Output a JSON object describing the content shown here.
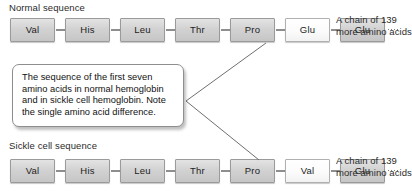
{
  "figure": {
    "title_normal": "Normal sequence",
    "title_sickle": "Sickle cell sequence",
    "callout_text": "The sequence of the first seven amino acids in normal hemoglobin and in sickle cell hemoglobin. Note the single amino acid difference.",
    "tail_normal": "A chain of 139 more amino acids",
    "tail_sickle": "A chain of 139 more amino acids",
    "normal_sequence": [
      {
        "label": "Val",
        "highlight": false
      },
      {
        "label": "His",
        "highlight": false
      },
      {
        "label": "Leu",
        "highlight": false
      },
      {
        "label": "Thr",
        "highlight": false
      },
      {
        "label": "Pro",
        "highlight": false
      },
      {
        "label": "Glu",
        "highlight": true
      },
      {
        "label": "Glu",
        "highlight": false
      }
    ],
    "sickle_sequence": [
      {
        "label": "Val",
        "highlight": false
      },
      {
        "label": "His",
        "highlight": false
      },
      {
        "label": "Leu",
        "highlight": false
      },
      {
        "label": "Thr",
        "highlight": false
      },
      {
        "label": "Pro",
        "highlight": false
      },
      {
        "label": "Val",
        "highlight": true
      },
      {
        "label": "Glu",
        "highlight": false
      }
    ],
    "colors": {
      "box_fill": "#d2d2d2",
      "box_fill_highlight": "#ffffff",
      "box_border": "#9a9a9a",
      "connector": "#8e8e8e",
      "text": "#1d1d1d",
      "callout_border": "#8e8e8e",
      "background": "#ffffff"
    },
    "layout": {
      "box_width": 45,
      "box_height": 24,
      "box_pitch": 55,
      "first_box_left": 10,
      "row_normal_top": 18,
      "row_sickle_top": 159
    }
  }
}
